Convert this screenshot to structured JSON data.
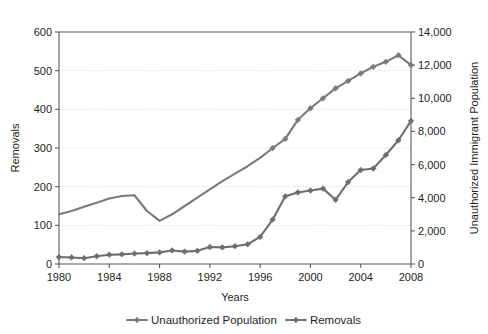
{
  "chart_data": {
    "type": "line",
    "title": "",
    "subtitle": "",
    "xlabel": "Years",
    "ylabel": "Removals",
    "y2label": "Unauthorized Immigrant Population",
    "x": [
      1980,
      1981,
      1982,
      1983,
      1984,
      1985,
      1986,
      1987,
      1988,
      1989,
      1990,
      1991,
      1992,
      1993,
      1994,
      1995,
      1996,
      1997,
      1998,
      1999,
      2000,
      2001,
      2002,
      2003,
      2004,
      2005,
      2006,
      2007,
      2008
    ],
    "xlim": [
      1980,
      2008
    ],
    "xticks": [
      1980,
      1984,
      1988,
      1992,
      1996,
      2000,
      2004,
      2008
    ],
    "xtick_labels": [
      "1980",
      "1984",
      "1988",
      "1992",
      "1996",
      "2000",
      "2004",
      "2008"
    ],
    "ylim": [
      0,
      600
    ],
    "yticks": [
      0,
      100,
      200,
      300,
      400,
      500,
      600
    ],
    "ytick_labels": [
      "0",
      "100",
      "200",
      "300",
      "400",
      "500",
      "600"
    ],
    "y2lim": [
      0,
      14000
    ],
    "y2ticks": [
      0,
      2000,
      4000,
      6000,
      8000,
      10000,
      12000,
      14000
    ],
    "y2tick_labels": [
      "0",
      "2,000",
      "4,000",
      "6,000",
      "8,000",
      "10,000",
      "12,000",
      "14,000"
    ],
    "grid": true,
    "legend_position": "bottom",
    "series": [
      {
        "name": "Unauthorized Population",
        "axis": "right",
        "color": "#7a7a7a",
        "marker": "diamond",
        "values": [
          3000,
          3200,
          3450,
          3700,
          3950,
          4100,
          4150,
          3200,
          2600,
          3000,
          3500,
          4000,
          4500,
          5000,
          5450,
          5900,
          6400,
          7000,
          7550,
          8700,
          9400,
          10000,
          10600,
          11050,
          11500,
          11900,
          12200,
          12600,
          12000
        ]
      },
      {
        "name": "Removals",
        "axis": "left",
        "color": "#6e6e6e",
        "marker": "diamond",
        "values": [
          18,
          17,
          15,
          20,
          24,
          25,
          27,
          28,
          30,
          35,
          32,
          34,
          44,
          43,
          46,
          51,
          70,
          115,
          175,
          185,
          190,
          195,
          166,
          212,
          243,
          247,
          282,
          320,
          370
        ]
      }
    ]
  },
  "legend": {
    "items": [
      {
        "label": "Unauthorized Population"
      },
      {
        "label": "Removals"
      }
    ]
  }
}
